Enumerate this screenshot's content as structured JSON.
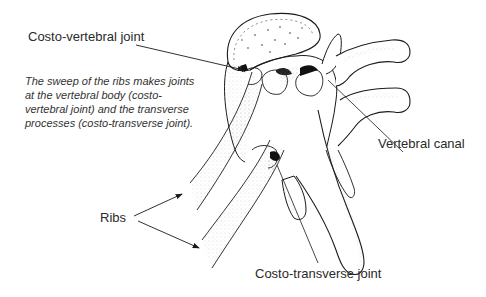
{
  "diagram": {
    "labels": {
      "costo_vertebral": "Costo-vertebral joint",
      "vertebral_canal": "Vertebral canal",
      "ribs": "Ribs",
      "costo_transverse": "Costo-transverse joint"
    },
    "caption_lines": [
      "The sweep of the ribs makes joints",
      "at the vertebral body (costo-",
      "vertebral joint) and the transverse",
      "processes (costo-transverse joint)."
    ],
    "colors": {
      "line": "#1a1a1a",
      "background": "#ffffff",
      "stipple": "#555555"
    }
  }
}
